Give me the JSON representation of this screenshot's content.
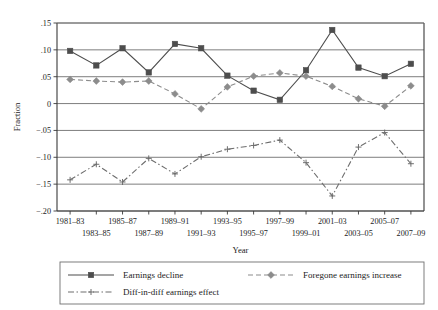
{
  "chart_data": {
    "type": "line",
    "title": "",
    "xlabel": "Year",
    "ylabel": "Fraction",
    "categories": [
      "1981–83",
      "1983–85",
      "1985–87",
      "1987–89",
      "1989–91",
      "1991–93",
      "1993–95",
      "1995–97",
      "1997–99",
      "1999–01",
      "2001–03",
      "2003–05",
      "2005–07",
      "2007–09"
    ],
    "ylim": [
      -0.2,
      0.15
    ],
    "yticks": [
      0.15,
      0.1,
      0.05,
      0,
      -0.05,
      -0.1,
      -0.15,
      -0.2
    ],
    "ytick_labels": [
      ".15",
      ".10",
      ".05",
      "0",
      "−.05",
      "−.10",
      "−.15",
      "−.20"
    ],
    "grid": true,
    "grid_axis": "y",
    "legend_position": "below",
    "series": [
      {
        "name": "Earnings decline",
        "color": "#4d4d4d",
        "marker": "square",
        "linestyle": "solid",
        "values": [
          0.098,
          0.071,
          0.103,
          0.058,
          0.111,
          0.103,
          0.052,
          0.024,
          0.007,
          0.062,
          0.137,
          0.067,
          0.051,
          0.074
        ]
      },
      {
        "name": "Foregone earnings increase",
        "color": "#8c8c8c",
        "marker": "diamond",
        "linestyle": "dashed",
        "values": [
          0.045,
          0.042,
          0.04,
          0.042,
          0.018,
          -0.01,
          0.031,
          0.051,
          0.057,
          0.051,
          0.032,
          0.009,
          -0.005,
          0.033
        ]
      },
      {
        "name": "Diff-in-diff earnings effect",
        "color": "#6e6e6e",
        "marker": "plus",
        "linestyle": "dashdot",
        "values": [
          -0.142,
          -0.113,
          -0.146,
          -0.102,
          -0.131,
          -0.099,
          -0.085,
          -0.078,
          -0.068,
          -0.11,
          -0.172,
          -0.081,
          -0.054,
          -0.112
        ]
      }
    ]
  },
  "axes": {
    "y_title": "Fraction",
    "x_title": "Year"
  },
  "legend": {
    "items": [
      {
        "label": "Earnings decline",
        "key": "earnings-decline"
      },
      {
        "label": "Foregone earnings increase",
        "key": "foregone-earnings-increase"
      },
      {
        "label": "Diff-in-diff earnings effect",
        "key": "diff-in-diff-earnings-effect"
      }
    ]
  }
}
